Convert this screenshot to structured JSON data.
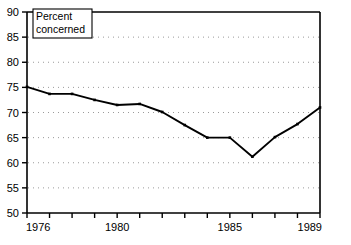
{
  "chart_data": {
    "type": "line",
    "title": "",
    "subtitle": "",
    "xlabel": "",
    "ylabel": "",
    "legend": {
      "position": "top-left-inset",
      "entries": [
        "Percent concerned"
      ],
      "line1": "Percent",
      "line2": "concerned"
    },
    "grid": true,
    "grid_style": "dotted-horizontal",
    "x": [
      1976,
      1977,
      1978,
      1979,
      1980,
      1981,
      1982,
      1983,
      1984,
      1985,
      1986,
      1987,
      1988,
      1989
    ],
    "xlim": [
      1976,
      1989
    ],
    "ylim": [
      50,
      90
    ],
    "xticks": [
      1976,
      1977,
      1978,
      1979,
      1980,
      1981,
      1982,
      1983,
      1984,
      1985,
      1986,
      1987,
      1988,
      1989
    ],
    "xtick_labels_shown": [
      "1976",
      "1980",
      "1985",
      "1989"
    ],
    "yticks": [
      50,
      55,
      60,
      65,
      70,
      75,
      80,
      85,
      90
    ],
    "ytick_labels": [
      "50",
      "55",
      "60",
      "65",
      "70",
      "75",
      "80",
      "85",
      "90"
    ],
    "series": [
      {
        "name": "Percent concerned",
        "color": "#000000",
        "marker": "dot",
        "values": [
          75.1,
          73.7,
          73.7,
          72.5,
          71.5,
          71.7,
          70.1,
          67.5,
          65.0,
          65.0,
          61.2,
          65.1,
          67.7,
          71.0
        ]
      }
    ]
  },
  "axes": {
    "x_labels": [
      {
        "value": 1976,
        "text": "1976"
      },
      {
        "value": 1980,
        "text": "1980"
      },
      {
        "value": 1985,
        "text": "1985"
      },
      {
        "value": 1989,
        "text": "1989"
      }
    ],
    "y_labels": [
      {
        "value": 90,
        "text": "90"
      },
      {
        "value": 85,
        "text": "85"
      },
      {
        "value": 80,
        "text": "80"
      },
      {
        "value": 75,
        "text": "75"
      },
      {
        "value": 70,
        "text": "70"
      },
      {
        "value": 65,
        "text": "65"
      },
      {
        "value": 60,
        "text": "60"
      },
      {
        "value": 55,
        "text": "55"
      },
      {
        "value": 50,
        "text": "50"
      }
    ]
  },
  "colors": {
    "line": "#000000",
    "axis": "#000000",
    "grid": "#9a9a9a",
    "background": "#ffffff"
  }
}
